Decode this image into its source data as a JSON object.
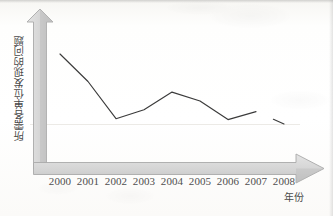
{
  "chart_data": {
    "type": "line",
    "title": "",
    "subtitle": "",
    "xlabel": "年份",
    "ylabel": "所需各单位发现的问题",
    "categories": [
      "2000",
      "2001",
      "2002",
      "2003",
      "2004",
      "2005",
      "2006",
      "2007",
      "2008"
    ],
    "x": [
      2000,
      2001,
      2002,
      2003,
      2004,
      2005,
      2006,
      2007,
      2008
    ],
    "series": [
      {
        "name": "所需各单位发现的问题",
        "values": [
          9.3,
          6.2,
          2.0,
          3.0,
          5.0,
          4.0,
          1.9,
          2.8,
          1.4
        ],
        "color": "#3b3b3b"
      }
    ],
    "values": [
      9.3,
      6.2,
      2.0,
      3.0,
      5.0,
      4.0,
      1.9,
      2.8,
      1.4
    ],
    "xlim": [
      2000,
      2008
    ],
    "ylim": [
      0,
      10
    ],
    "grid": false,
    "legend": false,
    "legend_position": "none",
    "markers": false,
    "axis_style": "block-arrow",
    "annotations": [
      "line has a small break between 2007 and 2008"
    ]
  },
  "axes": {
    "y_axis_label": "所需各单位发现的问题",
    "x_axis_label": "年份",
    "x_tick_labels": [
      "2000",
      "2001",
      "2002",
      "2003",
      "2004",
      "2005",
      "2006",
      "2007",
      "2008"
    ],
    "y_tick_labels": []
  },
  "colors": {
    "line": "#3b3b3b",
    "axis_fill": "#d6d6d6",
    "axis_stroke": "#a8a8a8",
    "axis_shadow": "#bcbcbc",
    "text": "#4a4a4a",
    "background": "#ffffff"
  }
}
